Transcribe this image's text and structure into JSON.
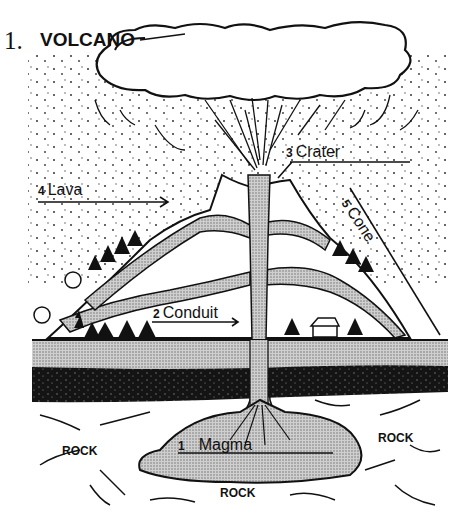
{
  "title": {
    "number": "1.",
    "text": "VOLCANO"
  },
  "labels": [
    {
      "id": "magma",
      "number": "1",
      "text": "Magma"
    },
    {
      "id": "conduit",
      "number": "2",
      "text": "Conduit"
    },
    {
      "id": "crater",
      "number": "3",
      "text": "Crater"
    },
    {
      "id": "lava",
      "number": "4",
      "text": "Lava"
    },
    {
      "id": "cone",
      "number": "5",
      "text": "Cone"
    }
  ],
  "rock_labels": [
    "ROCK",
    "ROCK",
    "ROCK"
  ],
  "colors": {
    "ink": "#111111",
    "stipple": "#bdbdbd",
    "dark_layer": "#141414",
    "paper": "#ffffff"
  }
}
